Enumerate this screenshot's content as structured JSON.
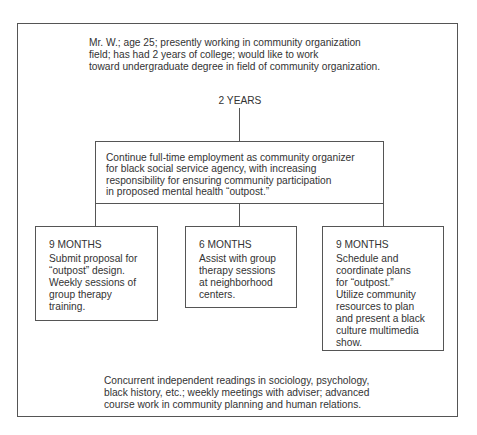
{
  "intro": {
    "lines": [
      "Mr. W.; age 25; presently working in community organization",
      "field; has had 2 years of college; would like to work",
      "toward undergraduate degree in field of community organization."
    ]
  },
  "duration_label": "2 YEARS",
  "main_box": {
    "lines": [
      "Continue full-time employment as community organizer",
      "for black social service agency, with increasing",
      "responsibility for ensuring community participation",
      "in proposed mental health “outpost.”"
    ]
  },
  "phases": [
    {
      "title": "9 MONTHS",
      "lines": [
        "Submit proposal for",
        "“outpost” design.",
        "Weekly sessions of",
        "group therapy",
        "training."
      ]
    },
    {
      "title": "6 MONTHS",
      "lines": [
        "Assist with group",
        "therapy sessions",
        "at neighborhood",
        "centers."
      ]
    },
    {
      "title": "9 MONTHS",
      "lines": [
        "Schedule and",
        "coordinate plans",
        "for “outpost.”",
        "Utilize community",
        "resources to plan",
        "and present a black",
        "culture multimedia",
        "show."
      ]
    }
  ],
  "footer": {
    "lines": [
      "Concurrent independent readings in sociology, psychology,",
      "black history, etc.; weekly meetings with adviser; advanced",
      "course work in community planning and human relations."
    ]
  },
  "colors": {
    "line": "#555555",
    "text": "#333333",
    "background": "#ffffff"
  }
}
